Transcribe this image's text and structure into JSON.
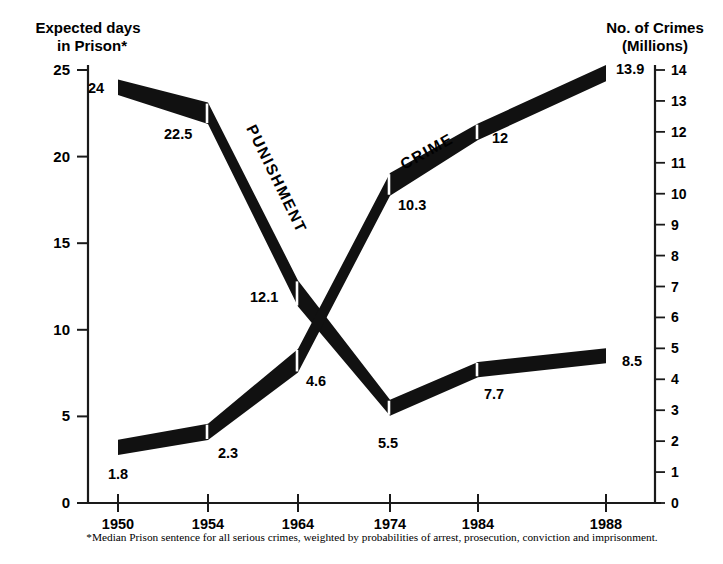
{
  "chart_data": {
    "type": "line",
    "title": "",
    "categories": [
      "1950",
      "1954",
      "1964",
      "1974",
      "1984",
      "1988"
    ],
    "x_tick_px": [
      118,
      208,
      298,
      390,
      478,
      606
    ],
    "xlabel": "",
    "left_axis": {
      "label_line1": "Expected days",
      "label_line2": "in Prison*",
      "ylim": [
        0,
        25
      ],
      "ticks": [
        "0",
        "5",
        "10",
        "15",
        "20",
        "25"
      ],
      "tick_values": [
        0,
        5,
        10,
        15,
        20,
        25
      ]
    },
    "right_axis": {
      "label_line1": "No. of Crimes",
      "label_line2": "(Millions)",
      "ylim": [
        0,
        14
      ],
      "ticks": [
        "0",
        "1",
        "2",
        "3",
        "4",
        "5",
        "6",
        "7",
        "8",
        "9",
        "10",
        "11",
        "12",
        "13",
        "14"
      ],
      "tick_values": [
        0,
        1,
        2,
        3,
        4,
        5,
        6,
        7,
        8,
        9,
        10,
        11,
        12,
        13,
        14
      ]
    },
    "grid": false,
    "legend_position": "inline-on-series",
    "series": [
      {
        "name": "PUNISHMENT",
        "axis": "left",
        "color": "#111111",
        "values": [
          24,
          22.5,
          12.1,
          5.5,
          7.7,
          8.5
        ],
        "point_labels": [
          "24",
          "22.5",
          "12.1",
          "5.5",
          "7.7",
          "8.5"
        ]
      },
      {
        "name": "CRIME",
        "axis": "right",
        "color": "#111111",
        "values": [
          1.8,
          2.3,
          4.6,
          10.3,
          12,
          13.9
        ],
        "point_labels": [
          "1.8",
          "2.3",
          "4.6",
          "10.3",
          "12",
          "13.9"
        ]
      }
    ],
    "footnote": "*Median Prison sentence for all serious crimes, weighted by probabilities of arrest, prosecution, conviction and imprisonment."
  }
}
